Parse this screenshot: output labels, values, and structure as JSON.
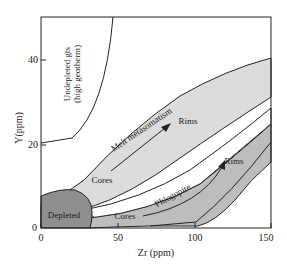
{
  "diagram": {
    "title": "",
    "x_axis": {
      "label": "Zr (ppm)",
      "ticks": [
        "0",
        "50",
        "100",
        "150"
      ],
      "range": [
        0,
        150
      ]
    },
    "y_axis": {
      "label": "Y(ppm)",
      "ticks": [
        "0",
        "20",
        "40"
      ],
      "range": [
        0,
        50
      ]
    },
    "regions": {
      "undepleted": {
        "line1": "Undepleted gts",
        "line2": "(high geotherm)",
        "fill": "#ffffff"
      },
      "melt": {
        "label": "Melt metasomatism",
        "fill": "#dcdcdc"
      },
      "phlogopite": {
        "label": "Phlogopite",
        "fill": "#bdbdbd"
      },
      "depleted": {
        "label": "Depleted",
        "fill": "#8f8f8f"
      }
    },
    "arrows": {
      "melt_start": "Cores",
      "melt_end": "Rims",
      "phlog_start": "Cores",
      "phlog_end": "Rims"
    }
  }
}
